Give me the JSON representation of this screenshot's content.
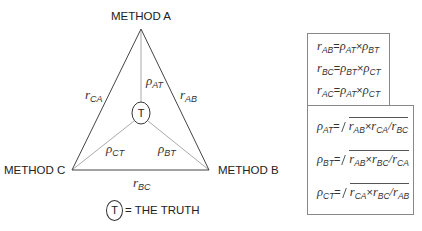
{
  "diagram": {
    "vertices": {
      "a": {
        "label": "METHOD A"
      },
      "b": {
        "label": "METHOD B"
      },
      "c": {
        "label": "METHOD C"
      }
    },
    "center": {
      "symbol": "T"
    },
    "edges": {
      "ca": {
        "sym": "r",
        "sub": "CA"
      },
      "ab": {
        "sym": "r",
        "sub": "AB"
      },
      "bc": {
        "sym": "r",
        "sub": "BC"
      }
    },
    "spokes": {
      "at": {
        "sym": "ρ",
        "sub": "AT"
      },
      "bt": {
        "sym": "ρ",
        "sub": "BT"
      },
      "ct": {
        "sym": "ρ",
        "sub": "CT"
      }
    },
    "legend": {
      "symbol": "T",
      "text": "= THE TRUTH"
    },
    "colors": {
      "triangle": "#444444",
      "spokes": "#aaaaaa"
    }
  },
  "equations": {
    "products": [
      {
        "lhs": "r",
        "lhs_sub": "AB",
        "a": "ρ",
        "a_sub": "AT",
        "op": "×",
        "b": "ρ",
        "b_sub": "BT"
      },
      {
        "lhs": "r",
        "lhs_sub": "BC",
        "a": "ρ",
        "a_sub": "BT",
        "op": "×",
        "b": "ρ",
        "b_sub": "CT"
      },
      {
        "lhs": "r",
        "lhs_sub": "AC",
        "a": "ρ",
        "a_sub": "AT",
        "op": "×",
        "b": "ρ",
        "b_sub": "CT"
      }
    ],
    "roots": [
      {
        "lhs": "ρ",
        "lhs_sub": "AT",
        "x": "r",
        "x_sub": "AB",
        "y": "r",
        "y_sub": "CA",
        "z": "r",
        "z_sub": "BC"
      },
      {
        "lhs": "ρ",
        "lhs_sub": "BT",
        "x": "r",
        "x_sub": "AB",
        "y": "r",
        "y_sub": "BC",
        "z": "r",
        "z_sub": "CA"
      },
      {
        "lhs": "ρ",
        "lhs_sub": "CT",
        "x": "r",
        "x_sub": "CA",
        "y": "r",
        "y_sub": "BC",
        "z": "r",
        "z_sub": "AB"
      }
    ],
    "eq": "=",
    "times": "×",
    "div": "/"
  }
}
